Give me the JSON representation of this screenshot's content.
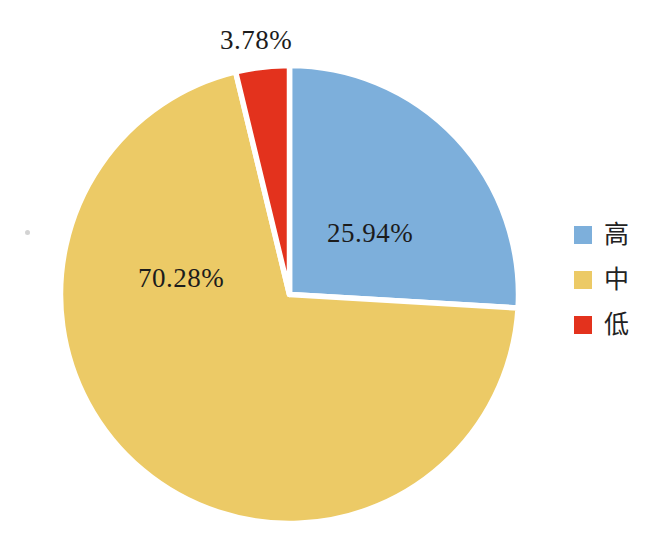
{
  "figure": {
    "background": "#ffffff"
  },
  "chart_data": {
    "type": "pie",
    "title": "",
    "categories": [
      "高",
      "中",
      "低"
    ],
    "names": [
      "high",
      "medium",
      "low"
    ],
    "values": [
      25.94,
      70.28,
      3.78
    ],
    "labels": [
      "25.94%",
      "70.28%",
      "3.78%"
    ],
    "colors": [
      "#7dafdb",
      "#ecca66",
      "#e3321d"
    ],
    "separator_color": "#ffffff",
    "label_color": "#1c1c1c",
    "start_angle_deg": 0,
    "direction": "clockwise",
    "legend_position": "right",
    "label_placement": {
      "high": "inside",
      "medium": "inside",
      "low": "outside-top"
    }
  },
  "legend": {
    "items": [
      {
        "label": "高",
        "color": "#7dafdb"
      },
      {
        "label": "中",
        "color": "#ecca66"
      },
      {
        "label": "低",
        "color": "#e3321d"
      }
    ]
  }
}
